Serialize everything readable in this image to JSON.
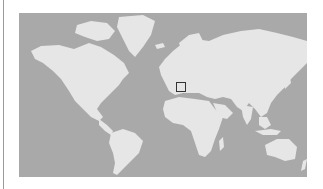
{
  "map": {
    "type": "world-locator-map",
    "projection": "mercator",
    "colors": {
      "ocean": "#a9a9a9",
      "land": "#e6e6e6",
      "marker": "#333333",
      "rule": "#9a9a9a"
    },
    "marker": {
      "shape": "square",
      "region": "Eastern Mediterranean / Greece",
      "x": 176,
      "y": 82,
      "width": 10,
      "height": 10
    }
  }
}
